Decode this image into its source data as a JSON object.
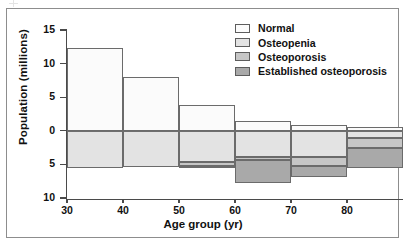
{
  "figure": {
    "x_axis_title": "Age group (yr)",
    "y_axis_title": "Population (millions)"
  },
  "legend": {
    "items": [
      {
        "label": "Normal",
        "color": "#fbfbfb"
      },
      {
        "label": "Osteopenia",
        "color": "#e3e3e3"
      },
      {
        "label": "Osteoporosis",
        "color": "#c6c6c6"
      },
      {
        "label": "Established osteoporosis",
        "color": "#a9a9a9"
      }
    ]
  },
  "axes": {
    "y_ticks": [
      {
        "label": "15",
        "value": 15
      },
      {
        "label": "10",
        "value": 10
      },
      {
        "label": "5",
        "value": 5
      },
      {
        "label": "0",
        "value": 0
      },
      {
        "label": "5",
        "value": -5
      },
      {
        "label": "10",
        "value": -10
      }
    ],
    "x_ticks": [
      {
        "label": "30",
        "value": 30
      },
      {
        "label": "40",
        "value": 40
      },
      {
        "label": "50",
        "value": 50
      },
      {
        "label": "60",
        "value": 60
      },
      {
        "label": "70",
        "value": 70
      },
      {
        "label": "80",
        "value": 80
      }
    ]
  },
  "chart_data": {
    "type": "bar",
    "title": "",
    "xlabel": "Age group (yr)",
    "ylabel": "Population (millions)",
    "xlim": [
      30,
      90
    ],
    "ylim": [
      -10,
      15
    ],
    "grid": false,
    "legend_position": "top-right",
    "orientation": "vertical-stacked-diverging",
    "note": "Values above the zero line are plotted positive; values below the zero line are plotted as stacked negative magnitudes, with the y-axis labelled with absolute values.",
    "categories": [
      "30-40",
      "40-50",
      "50-60",
      "60-70",
      "70-80",
      "80+"
    ],
    "x_edges": [
      30,
      40,
      50,
      60,
      70,
      80,
      90
    ],
    "series": [
      {
        "name": "Normal",
        "direction": "up",
        "values": [
          12.3,
          8.0,
          3.8,
          1.4,
          0.9,
          0.6
        ]
      },
      {
        "name": "Osteopenia",
        "direction": "down",
        "values": [
          5.5,
          5.4,
          4.6,
          3.9,
          3.9,
          1.0
        ]
      },
      {
        "name": "Osteoporosis",
        "direction": "down",
        "values": [
          0.0,
          0.0,
          0.7,
          0.5,
          1.3,
          1.6
        ]
      },
      {
        "name": "Established osteoporosis",
        "direction": "down",
        "values": [
          0.0,
          0.0,
          0.3,
          3.4,
          1.7,
          3.0
        ]
      }
    ]
  }
}
